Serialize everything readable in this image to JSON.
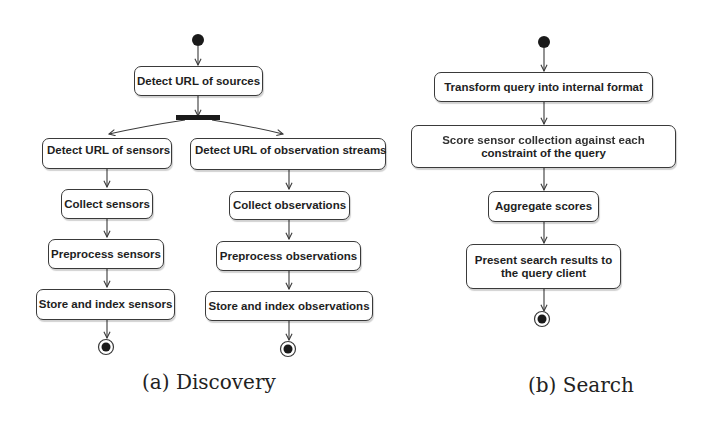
{
  "diagram": {
    "type": "uml-activity",
    "colors": {
      "stroke": "#3a3a3a",
      "node_fill": "#ffffff",
      "text": "#1e1e1e",
      "background": "#ffffff"
    },
    "discovery": {
      "caption": "(a) Discovery",
      "root": "Detect URL of sources",
      "sensors_branch": [
        "Detect URL of sensors",
        "Collect sensors",
        "Preprocess sensors",
        "Store and index sensors"
      ],
      "observations_branch": [
        "Detect URL of observation streams",
        "Collect observations",
        "Preprocess observations",
        "Store and index observations"
      ]
    },
    "search": {
      "caption": "(b) Search",
      "steps": [
        {
          "line1": "Transform query into internal format",
          "line2": ""
        },
        {
          "line1": "Score sensor collection against each",
          "line2": "constraint of the query"
        },
        {
          "line1": "Aggregate scores",
          "line2": ""
        },
        {
          "line1": "Present search results to",
          "line2": "the query client"
        }
      ]
    }
  }
}
